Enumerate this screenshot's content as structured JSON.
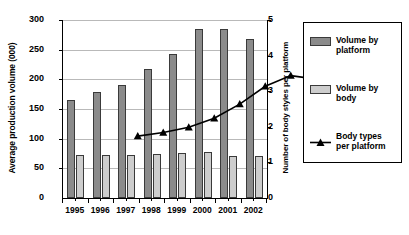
{
  "chart_data": {
    "type": "bar",
    "title": "",
    "categories": [
      "1995",
      "1996",
      "1997",
      "1998",
      "1999",
      "2000",
      "2001",
      "2002"
    ],
    "series": [
      {
        "name": "Volume by platform",
        "type": "bar",
        "axis": "left",
        "color": "#8b8b8b",
        "values": [
          165,
          178,
          190,
          218,
          243,
          285,
          285,
          268
        ]
      },
      {
        "name": "Volume by body",
        "type": "bar",
        "axis": "left",
        "color": "#cdcdcd",
        "values": [
          73,
          73,
          73,
          74,
          76,
          77,
          70,
          70
        ]
      },
      {
        "name": "Body types per platform",
        "type": "line",
        "axis": "right",
        "color": "#000000",
        "marker": "triangle",
        "values": [
          2.3,
          2.4,
          2.55,
          2.8,
          3.2,
          3.7,
          4.0,
          3.9
        ]
      }
    ],
    "xlabel": "",
    "ylabel": "Average production volume (000)",
    "ylabel_right": "Number of body styles per platform",
    "ylim": [
      0,
      300
    ],
    "ylim_right": [
      0,
      5
    ],
    "yticks": [
      "0",
      "50",
      "100",
      "150",
      "200",
      "250",
      "300"
    ],
    "yticks_right": [
      "0",
      "1",
      "2",
      "3",
      "4",
      "5"
    ],
    "grid": true,
    "legend_position": "right"
  },
  "axes": {
    "left_title": "Average production volume (000)",
    "right_title": "Number of body styles per platform",
    "left_ticks": [
      "300",
      "250",
      "200",
      "150",
      "100",
      "50",
      "0"
    ],
    "right_ticks": [
      "5",
      "4",
      "3",
      "2",
      "1",
      "0"
    ],
    "x_ticks": [
      "1995",
      "1996",
      "1997",
      "1998",
      "1999",
      "2000",
      "2001",
      "2002"
    ]
  },
  "legend": {
    "items": [
      {
        "label_line1": "Volume by",
        "label_line2": "platform",
        "swatch": "dark-gray-bar-swatch"
      },
      {
        "label_line1": "Volume by",
        "label_line2": "body",
        "swatch": "light-gray-bar-swatch"
      },
      {
        "label_line1": "Body types",
        "label_line2": "per platform",
        "swatch": "line-triangle-marker"
      }
    ]
  }
}
